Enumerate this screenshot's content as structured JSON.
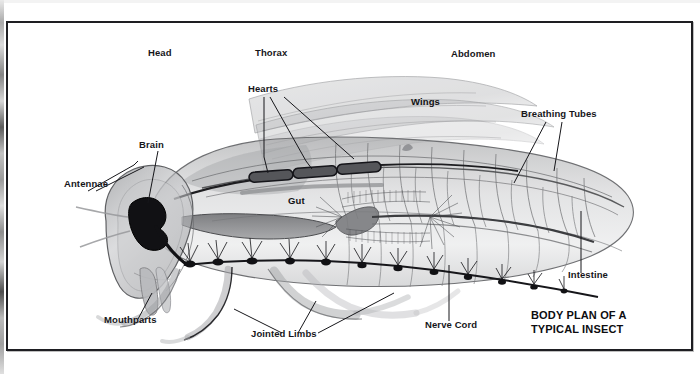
{
  "figure": {
    "title_line1": "BODY PLAN OF A",
    "title_line2": "TYPICAL INSECT",
    "frame_color": "#1e1e22",
    "ink_color": "#16161a",
    "paper_color": "#ffffff"
  },
  "region_labels": [
    {
      "id": "head",
      "text": "Head",
      "x": 148,
      "y": 48
    },
    {
      "id": "thorax",
      "text": "Thorax",
      "x": 255,
      "y": 48
    },
    {
      "id": "abdomen",
      "text": "Abdomen",
      "x": 451,
      "y": 50
    },
    {
      "id": "wings",
      "text": "Wings",
      "x": 410,
      "y": 97
    },
    {
      "id": "gut",
      "text": "Gut",
      "x": 286,
      "y": 197
    }
  ],
  "callout_labels": [
    {
      "id": "hearts",
      "text": "Hearts",
      "x": 247,
      "y": 88,
      "anchor": "start"
    },
    {
      "id": "breathing-tubes",
      "text": "Breathing Tubes",
      "x": 521,
      "y": 111,
      "anchor": "start"
    },
    {
      "id": "brain",
      "text": "Brain",
      "x": 139,
      "y": 142,
      "anchor": "start"
    },
    {
      "id": "antennae",
      "text": "Antennae",
      "x": 64,
      "y": 182,
      "anchor": "start"
    },
    {
      "id": "intestine",
      "text": "Intestine",
      "x": 568,
      "y": 271,
      "anchor": "start"
    },
    {
      "id": "mouthparts",
      "text": "Mouthparts",
      "x": 104,
      "y": 317,
      "anchor": "start"
    },
    {
      "id": "jointed-limbs",
      "text": "Jointed Limbs",
      "x": 251,
      "y": 331,
      "anchor": "start"
    },
    {
      "id": "nerve-cord",
      "text": "Nerve Cord",
      "x": 425,
      "y": 322,
      "anchor": "start"
    }
  ],
  "title_position": {
    "x": 531,
    "y": 311
  },
  "anatomy_parts": [
    "head-capsule",
    "compound-eye",
    "brain",
    "antennae",
    "mouthparts",
    "thorax",
    "wings",
    "dorsal-vessel-hearts",
    "gut",
    "crop",
    "intestine",
    "malpighian-tubules",
    "tracheal-breathing-tubes",
    "ventral-nerve-cord",
    "ganglia",
    "jointed-limbs",
    "abdominal-segments"
  ]
}
